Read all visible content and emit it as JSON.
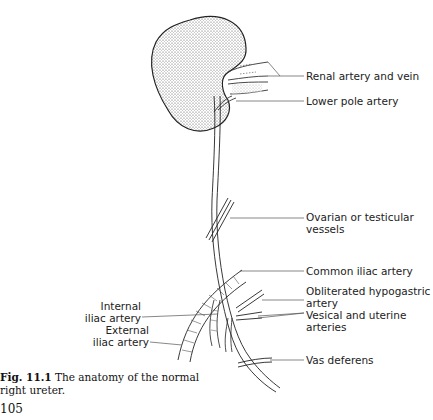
{
  "figure": {
    "number": "Fig. 11.1",
    "caption": "The anatomy of the normal right ureter.",
    "page_number": "105"
  },
  "labels": {
    "renal": "Renal artery and vein",
    "lower_pole": "Lower pole artery",
    "ovarian_1": "Ovarian or testicular",
    "ovarian_2": "vessels",
    "common_iliac": "Common iliac artery",
    "obliterated_1": "Obliterated hypogastric",
    "obliterated_2": "artery",
    "vesical_1": "Vesical and uterine",
    "vesical_2": "arteries",
    "vas": "Vas deferens",
    "internal_1": "Internal",
    "internal_2": "iliac artery",
    "external_1": "External",
    "external_2": "iliac artery"
  }
}
